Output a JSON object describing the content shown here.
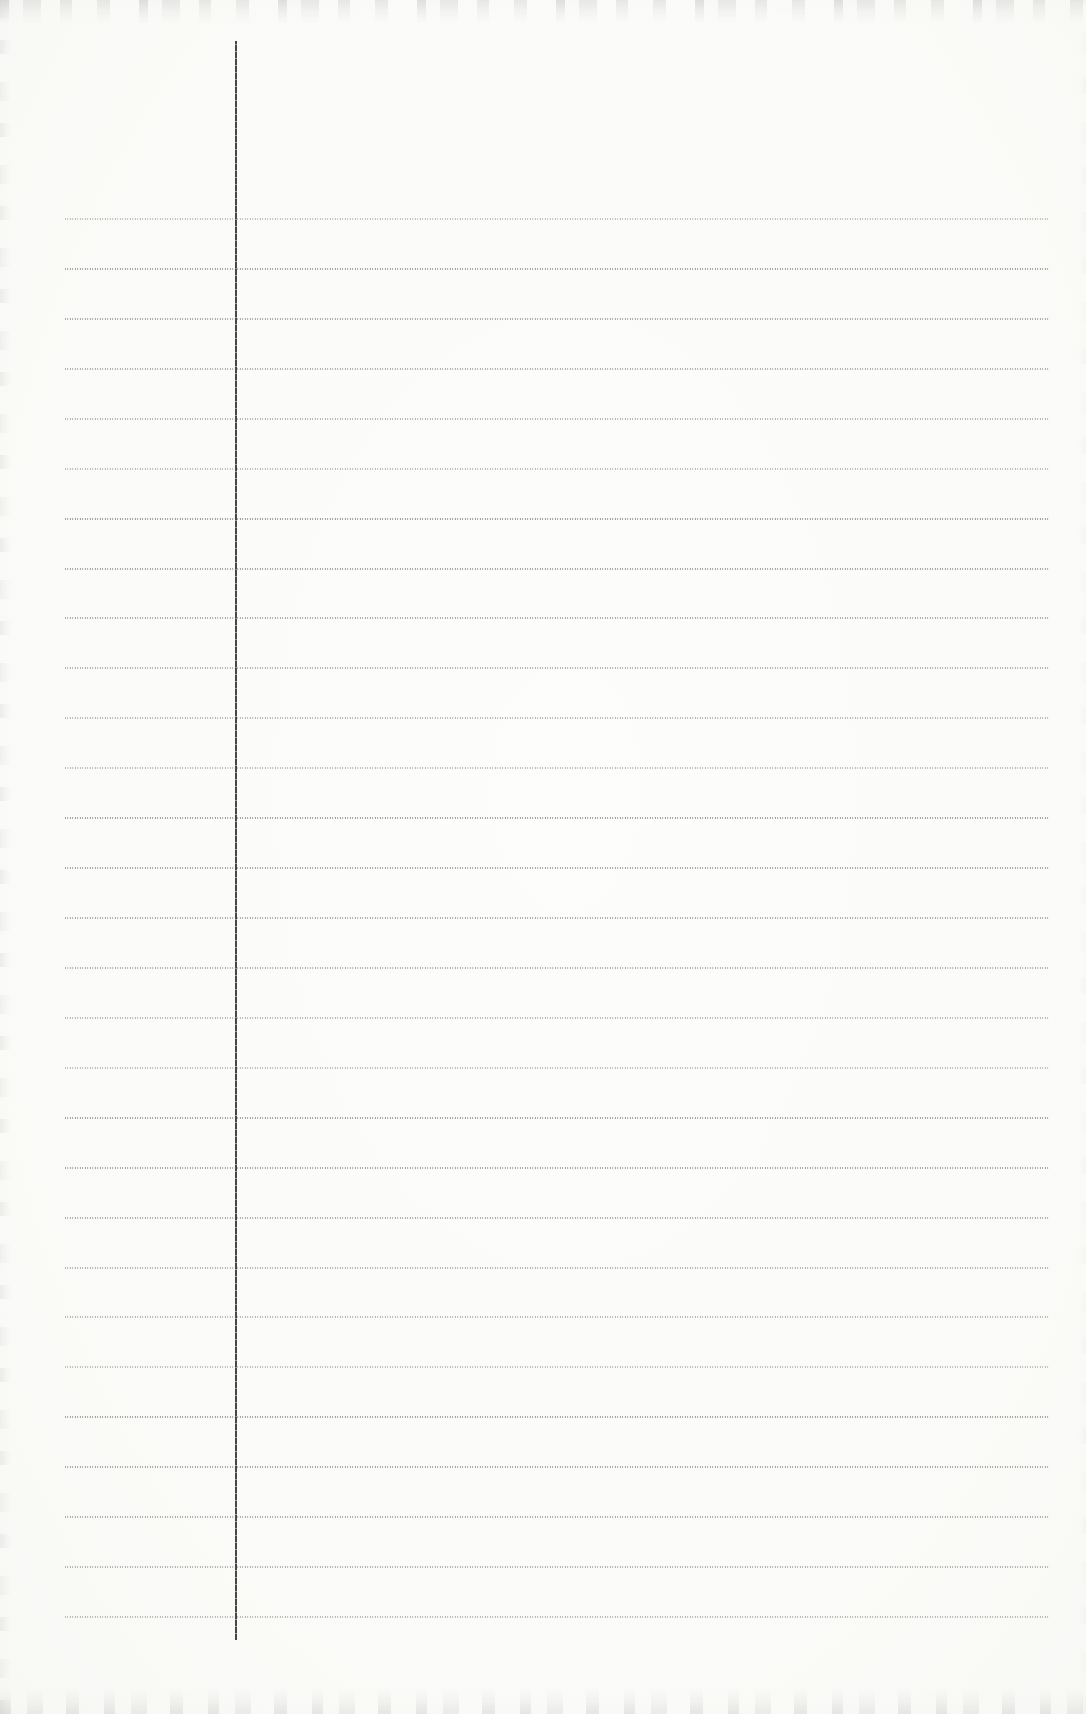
{
  "page": {
    "type": "blank-ruled-notebook-paper-scan",
    "text_content": "",
    "background_color": "#fbfbf9",
    "edge_noise_color": "#a8a8a8"
  },
  "ruling": {
    "horizontal": {
      "count": 29,
      "first_y_px": 218,
      "spacing_px": 49.93,
      "x_start_px": 65,
      "x_end_px": 1049,
      "color": "#9a9a9a",
      "style": "fine-dotted"
    },
    "margin": {
      "orientation": "vertical",
      "x_px": 235,
      "y_start_px": 41,
      "y_end_px": 1640,
      "width_px": 2,
      "color": "#474747",
      "style": "beaded"
    }
  }
}
